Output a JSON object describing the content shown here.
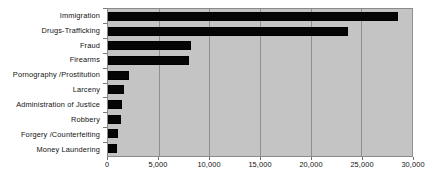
{
  "chart_data": {
    "type": "bar",
    "orientation": "horizontal",
    "title": "",
    "subtitle": "",
    "xlabel": "",
    "ylabel": "",
    "categories": [
      "Immigration",
      "Drugs-Trafficking",
      "Fraud",
      "Firearms",
      "Pornography /Prostitution",
      "Larceny",
      "Administration of  Justice",
      "Robbery",
      "Forgery /Counterfeiting",
      "Money  Laundering"
    ],
    "values": [
      28600,
      23700,
      8200,
      8000,
      2100,
      1600,
      1400,
      1300,
      1000,
      900
    ],
    "xlim": [
      0,
      30000
    ],
    "xtick_values": [
      0,
      5000,
      10000,
      15000,
      20000,
      25000,
      30000
    ],
    "xtick_labels": [
      "0",
      "5,000",
      "10,000",
      "15,000",
      "20,000",
      "25,000",
      "30,000"
    ],
    "grid": true,
    "grid_axis": "x",
    "legend": false,
    "legend_position": "none",
    "bar_color": "#050505",
    "plot_background": "#c4c4c4",
    "gridline_color": "#8f8f8f",
    "figure_background": "#ffffff"
  }
}
